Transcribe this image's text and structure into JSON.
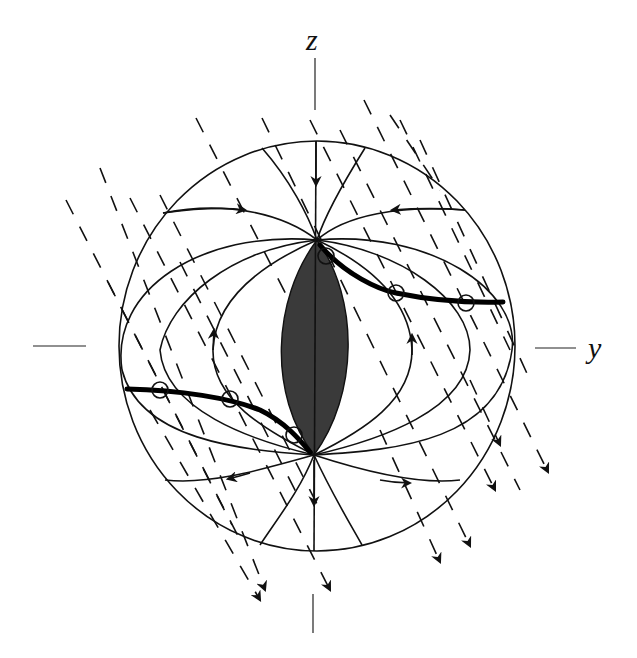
{
  "diagram": {
    "type": "field-line diagram in a sphere (meridional cross-section)",
    "axes": {
      "vertical_label": "z",
      "horizontal_label": "y"
    },
    "sphere": {
      "cx": 317,
      "cy": 346,
      "rx": 198,
      "ry": 205
    },
    "central_body": {
      "description": "dark shaded lens/spindle along z-axis",
      "top": [
        317,
        240
      ],
      "bottom": [
        314,
        455
      ],
      "half_width": 35,
      "fill": "#3a3a3a"
    },
    "thick_curves": [
      {
        "name": "upper-right trajectory",
        "markers": [
          [
            326,
            256
          ],
          [
            396,
            293
          ],
          [
            466,
            303
          ]
        ]
      },
      {
        "name": "lower-left trajectory",
        "markers": [
          [
            160,
            390
          ],
          [
            230,
            399
          ],
          [
            294,
            435
          ]
        ]
      }
    ],
    "dashed_flow": {
      "direction": "down-right",
      "arrowheads": 7
    },
    "field_line_arrows": {
      "count": 10
    }
  }
}
